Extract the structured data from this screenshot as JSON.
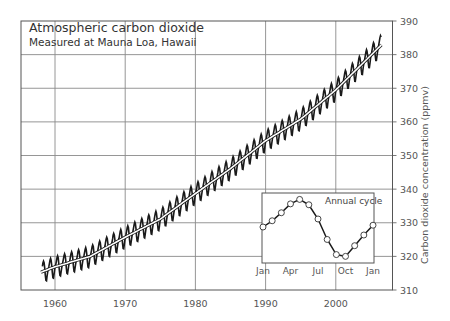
{
  "chart_data": {
    "type": "line",
    "title": "Atmospheric carbon dioxide",
    "subtitle": "Measured at Mauna Loa, Hawaii",
    "xlabel": "",
    "ylabel": "Carbon dioxide concentration (ppmv)",
    "xlim": [
      1955,
      2008
    ],
    "ylim": [
      310,
      390
    ],
    "grid": true,
    "y_axis_position": "right",
    "x_ticks": [
      1960,
      1970,
      1980,
      1990,
      2000
    ],
    "y_ticks": [
      310,
      320,
      330,
      340,
      350,
      360,
      370,
      380,
      390
    ],
    "series": [
      {
        "name": "Monthly mean (seasonal)",
        "style": "black zigzag",
        "description": "Monthly CO2 with seasonal oscillation of ~6 ppmv peak-to-trough",
        "x_start": 1958.2,
        "x_end": 2006.5,
        "seasonal_amplitude_ppmv": 3.2
      },
      {
        "name": "Annual average (trend)",
        "style": "white line with black outline",
        "x": [
          1958,
          1960,
          1965,
          1970,
          1975,
          1980,
          1985,
          1990,
          1995,
          2000,
          2005,
          2006
        ],
        "values": [
          315.3,
          316.9,
          320.0,
          325.7,
          331.1,
          338.7,
          346.1,
          354.4,
          360.8,
          369.5,
          379.8,
          381.9
        ]
      }
    ],
    "inset": {
      "title": "Annual cycle",
      "type": "line",
      "categories": [
        "Jan",
        "Feb",
        "Mar",
        "Apr",
        "May",
        "Jun",
        "Jul",
        "Aug",
        "Sep",
        "Oct",
        "Nov",
        "Dec",
        "Jan"
      ],
      "tick_labels": [
        "Jan",
        "Apr",
        "Jul",
        "Oct",
        "Jan"
      ],
      "values": [
        0.0,
        0.7,
        1.6,
        2.6,
        3.1,
        2.5,
        0.9,
        -1.4,
        -3.1,
        -3.3,
        -2.1,
        -0.9,
        0.2
      ],
      "units": "ppmv deviation from annual mean",
      "markers": "open circles"
    }
  }
}
